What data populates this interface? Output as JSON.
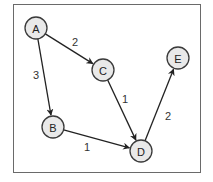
{
  "diagram": {
    "type": "weighted-directed-graph",
    "nodes": [
      {
        "id": "A",
        "label": "A",
        "x": 36,
        "y": 28
      },
      {
        "id": "B",
        "label": "B",
        "x": 53,
        "y": 127
      },
      {
        "id": "C",
        "label": "C",
        "x": 103,
        "y": 70
      },
      {
        "id": "D",
        "label": "D",
        "x": 141,
        "y": 151
      },
      {
        "id": "E",
        "label": "E",
        "x": 178,
        "y": 58
      }
    ],
    "edges": [
      {
        "from": "A",
        "to": "C",
        "weight": "2",
        "label_x": 75,
        "label_y": 42
      },
      {
        "from": "A",
        "to": "B",
        "weight": "3",
        "label_x": 36,
        "label_y": 75
      },
      {
        "from": "C",
        "to": "D",
        "weight": "1",
        "label_x": 125,
        "label_y": 99
      },
      {
        "from": "B",
        "to": "D",
        "weight": "1",
        "label_x": 87,
        "label_y": 147
      },
      {
        "from": "D",
        "to": "E",
        "weight": "2",
        "label_x": 168,
        "label_y": 116
      }
    ],
    "colors": {
      "node_fill": "#e9e9e9",
      "node_stroke": "#3a3a3a",
      "edge": "#222222",
      "frame": "#6a6a6a"
    }
  }
}
